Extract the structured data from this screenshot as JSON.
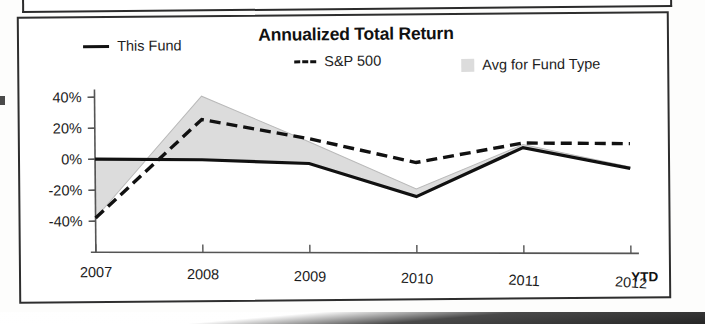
{
  "chart_data": {
    "type": "line",
    "title": "Annualized Total Return",
    "xlabel": "",
    "ylabel": "",
    "x": [
      "2007",
      "2008",
      "2009",
      "2010",
      "2011",
      "2012"
    ],
    "categories": [
      "2007",
      "2008",
      "2009",
      "2010",
      "2011",
      "2012"
    ],
    "x_tick_labels": [
      "2007",
      "2008",
      "2009",
      "2010",
      "2011",
      "2012"
    ],
    "x_axis_note": "YTD",
    "y_tick_labels": [
      "40%",
      "20%",
      "0%",
      "-20%",
      "-40%"
    ],
    "y_tick_values": [
      40,
      20,
      0,
      -20,
      -40
    ],
    "ylim": [
      -50,
      45
    ],
    "grid": false,
    "legend_position": "top",
    "series": [
      {
        "name": "This Fund",
        "style": "solid",
        "color": "#111111",
        "values": [
          0,
          -1,
          -4,
          -26,
          5,
          -9
        ]
      },
      {
        "name": "S&P 500",
        "style": "dashed",
        "color": "#111111",
        "values": [
          -38,
          25,
          12,
          -4,
          8,
          7
        ]
      },
      {
        "name": "Avg for Fund Type",
        "style": "shaded-band",
        "color": "#dcdcdc",
        "values": [
          -38,
          40,
          10,
          -21,
          7,
          -8
        ]
      }
    ],
    "legend": [
      {
        "label": "This Fund",
        "marker": "solid-line-swatch"
      },
      {
        "label": "S&P 500",
        "marker": "dashed-line-swatch"
      },
      {
        "label": "Avg for Fund Type",
        "marker": "gray-square-swatch"
      }
    ],
    "colors": {
      "line": "#111111",
      "band_fill": "#dcdcdc",
      "band_stroke": "#b9b9b9",
      "axis": "#555555",
      "frame": "#2e2e2e",
      "background": "#ffffff"
    }
  }
}
